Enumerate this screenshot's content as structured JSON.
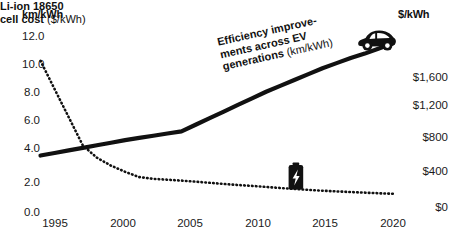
{
  "axes": {
    "left_title": "km/kWh",
    "right_title": "$/kWh",
    "left_ticks": [
      "12.0",
      "10.0",
      "8.0",
      "6.0",
      "4.0",
      "2.0",
      "0.0"
    ],
    "right_ticks": [
      "$1,600",
      "$1,200",
      "$800",
      "$400",
      "$0"
    ],
    "x_ticks": [
      "1995",
      "2000",
      "2005",
      "2010",
      "2015",
      "2020"
    ]
  },
  "annotations": {
    "efficiency": {
      "line1": "Efficiency improve-",
      "line2": "ments across EV",
      "line3": "generations ",
      "line3_unit": "(km/kWh)"
    },
    "battery": {
      "line1": "Li-ion 18650",
      "line2": "cell cost ",
      "line2_unit": "($/kWh)"
    }
  },
  "icons": {
    "car": "ev-car-icon",
    "battery": "battery-bolt-icon"
  },
  "colors": {
    "ink": "#111111",
    "background": "#ffffff"
  },
  "chart_data": {
    "type": "line",
    "title": "",
    "xlabel": "",
    "grid": false,
    "legend": "inline-annotations",
    "x": [
      1995,
      1996,
      1997,
      1998,
      1999,
      2000,
      2001,
      2002,
      2003,
      2004,
      2005,
      2006,
      2007,
      2008,
      2009,
      2010,
      2011,
      2012,
      2013,
      2014,
      2015,
      2016,
      2017,
      2018,
      2019,
      2020
    ],
    "axis_left": {
      "label": "km/kWh",
      "ylim": [
        0,
        12
      ],
      "ticks": [
        0,
        2,
        4,
        6,
        8,
        10,
        12
      ]
    },
    "axis_right": {
      "label": "$/kWh",
      "ylim": [
        0,
        2000
      ],
      "ticks": [
        0,
        400,
        800,
        1200,
        1600
      ]
    },
    "xlim": [
      1995,
      2020
    ],
    "series": [
      {
        "name": "Efficiency improvements across EV generations (km/kWh)",
        "axis": "left",
        "style": "solid-thick",
        "unit": "km/kWh",
        "values": [
          3.85,
          4.02,
          4.2,
          4.37,
          4.55,
          4.72,
          4.9,
          5.05,
          5.2,
          5.35,
          5.5,
          5.95,
          6.4,
          6.85,
          7.3,
          7.75,
          8.2,
          8.6,
          9.0,
          9.4,
          9.8,
          10.15,
          10.5,
          10.8,
          11.15,
          11.5
        ]
      },
      {
        "name": "Li-ion 18650 cell cost ($/kWh)",
        "axis": "right",
        "style": "dotted",
        "unit": "$/kWh",
        "values": [
          1660,
          1340,
          1020,
          700,
          560,
          470,
          400,
          340,
          320,
          310,
          300,
          288,
          275,
          262,
          250,
          240,
          228,
          216,
          205,
          195,
          185,
          177,
          170,
          163,
          156,
          150
        ]
      }
    ]
  }
}
